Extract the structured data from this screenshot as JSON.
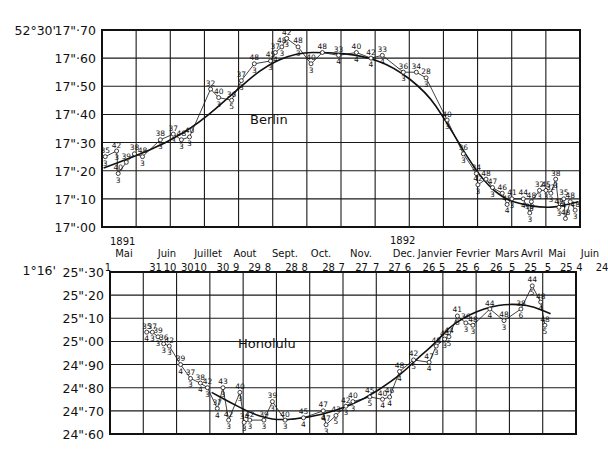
{
  "chart_data": [
    {
      "type": "line",
      "title": "Berlin",
      "station": "Berlin",
      "ylabel_prefix": "52°30'",
      "ylim": [
        17.0,
        17.7
      ],
      "ytick_labels": [
        "17\"·70",
        "17\"·60",
        "17\"·50",
        "17\"·40",
        "17\"·30",
        "17\"·20",
        "17\"·10",
        "17\"·00"
      ],
      "ytick_values": [
        17.7,
        17.6,
        17.5,
        17.4,
        17.3,
        17.2,
        17.1,
        17.0
      ],
      "xlim": [
        0,
        14
      ],
      "grid": true,
      "x_units": "months from 1891 Mai 1",
      "observations": [
        {
          "x": 0.1,
          "y": 17.25,
          "top": "35",
          "bottom": "3"
        },
        {
          "x": 0.45,
          "y": 17.27,
          "top": "42",
          "bottom": "3"
        },
        {
          "x": 0.5,
          "y": 17.19,
          "top": "40",
          "bottom": "3"
        },
        {
          "x": 0.75,
          "y": 17.23,
          "top": "39",
          "bottom": ""
        },
        {
          "x": 1.0,
          "y": 17.26,
          "top": "38",
          "bottom": ""
        },
        {
          "x": 1.25,
          "y": 17.25,
          "top": "48",
          "bottom": "3"
        },
        {
          "x": 1.8,
          "y": 17.31,
          "top": "38",
          "bottom": "3"
        },
        {
          "x": 2.2,
          "y": 17.33,
          "top": "37",
          "bottom": "3"
        },
        {
          "x": 2.45,
          "y": 17.31,
          "top": "48",
          "bottom": "3"
        },
        {
          "x": 2.7,
          "y": 17.32,
          "top": "40",
          "bottom": "3"
        },
        {
          "x": 3.35,
          "y": 17.49,
          "top": "32",
          "bottom": ""
        },
        {
          "x": 3.6,
          "y": 17.46,
          "top": "40",
          "bottom": "3"
        },
        {
          "x": 4.0,
          "y": 17.45,
          "top": "36",
          "bottom": "5"
        },
        {
          "x": 4.3,
          "y": 17.52,
          "top": "37",
          "bottom": "3"
        },
        {
          "x": 4.7,
          "y": 17.58,
          "top": "48",
          "bottom": "3"
        },
        {
          "x": 5.2,
          "y": 17.59,
          "top": "45",
          "bottom": "3"
        },
        {
          "x": 5.35,
          "y": 17.62,
          "top": "37",
          "bottom": "4"
        },
        {
          "x": 5.55,
          "y": 17.64,
          "top": "48",
          "bottom": "3"
        },
        {
          "x": 5.7,
          "y": 17.67,
          "top": "42",
          "bottom": "3"
        },
        {
          "x": 6.05,
          "y": 17.64,
          "top": "48",
          "bottom": "3"
        },
        {
          "x": 6.45,
          "y": 17.58,
          "top": "40",
          "bottom": "3"
        },
        {
          "x": 6.8,
          "y": 17.62,
          "top": "48",
          "bottom": ""
        },
        {
          "x": 7.3,
          "y": 17.61,
          "top": "33",
          "bottom": "4"
        },
        {
          "x": 7.85,
          "y": 17.62,
          "top": "40",
          "bottom": "4"
        },
        {
          "x": 8.3,
          "y": 17.6,
          "top": "42",
          "bottom": "4"
        },
        {
          "x": 8.65,
          "y": 17.61,
          "top": "33",
          "bottom": "4"
        },
        {
          "x": 9.3,
          "y": 17.55,
          "top": "36",
          "bottom": "3"
        },
        {
          "x": 9.7,
          "y": 17.55,
          "top": "34",
          "bottom": ""
        },
        {
          "x": 10.0,
          "y": 17.53,
          "top": "28",
          "bottom": "3"
        },
        {
          "x": 10.65,
          "y": 17.38,
          "top": "40",
          "bottom": "3"
        },
        {
          "x": 11.15,
          "y": 17.26,
          "top": "36",
          "bottom": "3"
        },
        {
          "x": 11.55,
          "y": 17.19,
          "top": "34",
          "bottom": ""
        },
        {
          "x": 11.6,
          "y": 17.15,
          "top": "42",
          "bottom": "3"
        },
        {
          "x": 11.85,
          "y": 17.17,
          "top": "48",
          "bottom": ""
        },
        {
          "x": 12.05,
          "y": 17.14,
          "top": "47",
          "bottom": "3"
        },
        {
          "x": 12.35,
          "y": 17.12,
          "top": "46",
          "bottom": ""
        },
        {
          "x": 12.5,
          "y": 17.08,
          "top": "45",
          "bottom": "4"
        },
        {
          "x": 12.65,
          "y": 17.1,
          "top": "41",
          "bottom": "3"
        },
        {
          "x": 13.0,
          "y": 17.1,
          "top": "44",
          "bottom": "4"
        },
        {
          "x": 13.25,
          "y": 17.09,
          "top": "48",
          "bottom": "3"
        },
        {
          "x": 13.2,
          "y": 17.05,
          "top": "39",
          "bottom": "3"
        },
        {
          "x": 13.5,
          "y": 17.13,
          "top": "32",
          "bottom": "3"
        },
        {
          "x": 13.7,
          "y": 17.13,
          "top": "45",
          "bottom": "3"
        },
        {
          "x": 13.85,
          "y": 17.12,
          "top": "32",
          "bottom": "3"
        }
      ],
      "observations_tail": [
        {
          "x": 14.0,
          "y": 17.17,
          "top": "38",
          "bottom": "3"
        },
        {
          "x": 14.1,
          "y": 17.07,
          "top": "48",
          "bottom": "3"
        },
        {
          "x": 14.25,
          "y": 17.1,
          "top": "35",
          "bottom": "4"
        },
        {
          "x": 14.45,
          "y": 17.09,
          "top": "48",
          "bottom": ""
        },
        {
          "x": 14.3,
          "y": 17.03,
          "top": "48",
          "bottom": ""
        },
        {
          "x": 14.6,
          "y": 17.06,
          "top": "48",
          "bottom": "3"
        }
      ],
      "mean_curve": [
        [
          0.05,
          17.21
        ],
        [
          1.0,
          17.25
        ],
        [
          2.0,
          17.3
        ],
        [
          3.0,
          17.37
        ],
        [
          4.0,
          17.47
        ],
        [
          5.0,
          17.57
        ],
        [
          6.0,
          17.62
        ],
        [
          7.0,
          17.62
        ],
        [
          8.0,
          17.61
        ],
        [
          9.0,
          17.57
        ],
        [
          10.0,
          17.48
        ],
        [
          10.6,
          17.38
        ],
        [
          11.2,
          17.26
        ],
        [
          11.8,
          17.16
        ],
        [
          12.4,
          17.1
        ],
        [
          13.0,
          17.08
        ],
        [
          13.5,
          17.07
        ],
        [
          14.0,
          17.07
        ],
        [
          14.7,
          17.09
        ]
      ]
    },
    {
      "type": "line",
      "title": "Honolulu",
      "station": "Honolulu",
      "ylabel_prefix": "1°16'",
      "ylim": [
        24.6,
        25.3
      ],
      "ytick_labels": [
        "25\"·30",
        "25\"·20",
        "25\"·10",
        "25\"·00",
        "24\"·90",
        "24\"·80",
        "24\"·70",
        "24\"·60"
      ],
      "ytick_values": [
        25.3,
        25.2,
        25.1,
        25.0,
        24.9,
        24.8,
        24.7,
        24.6
      ],
      "xlim": [
        0,
        14
      ],
      "grid": true,
      "observations": [
        {
          "x": 1.3,
          "y": 25.04,
          "top": "35",
          "bottom": "4"
        },
        {
          "x": 1.5,
          "y": 25.04,
          "top": "37",
          "bottom": "3"
        },
        {
          "x": 1.7,
          "y": 25.02,
          "top": "39",
          "bottom": "3"
        },
        {
          "x": 1.9,
          "y": 24.99,
          "top": "36",
          "bottom": "3"
        },
        {
          "x": 2.1,
          "y": 24.98,
          "top": "42",
          "bottom": "3"
        },
        {
          "x": 2.5,
          "y": 24.9,
          "top": "39",
          "bottom": "4"
        },
        {
          "x": 2.85,
          "y": 24.84,
          "top": "37",
          "bottom": "3"
        },
        {
          "x": 3.2,
          "y": 24.82,
          "top": "38",
          "bottom": "4"
        },
        {
          "x": 3.45,
          "y": 24.8,
          "top": "42",
          "bottom": "3"
        },
        {
          "x": 3.8,
          "y": 24.71,
          "top": "37",
          "bottom": "4"
        },
        {
          "x": 4.0,
          "y": 24.8,
          "top": "43",
          "bottom": "3"
        },
        {
          "x": 4.2,
          "y": 24.66,
          "top": "42",
          "bottom": "3"
        },
        {
          "x": 4.6,
          "y": 24.78,
          "top": "40",
          "bottom": "3"
        },
        {
          "x": 4.75,
          "y": 24.65,
          "top": "34",
          "bottom": "3"
        },
        {
          "x": 4.95,
          "y": 24.66,
          "top": "42",
          "bottom": "3"
        },
        {
          "x": 5.45,
          "y": 24.66,
          "top": "39",
          "bottom": "3"
        },
        {
          "x": 5.75,
          "y": 24.74,
          "top": "39",
          "bottom": "3"
        },
        {
          "x": 6.2,
          "y": 24.66,
          "top": "40",
          "bottom": "3"
        },
        {
          "x": 6.85,
          "y": 24.67,
          "top": "45",
          "bottom": "4"
        },
        {
          "x": 7.55,
          "y": 24.7,
          "top": "47",
          "bottom": "4"
        },
        {
          "x": 7.65,
          "y": 24.64,
          "top": "47",
          "bottom": "3"
        },
        {
          "x": 8.0,
          "y": 24.68,
          "top": "43",
          "bottom": "5"
        },
        {
          "x": 8.35,
          "y": 24.72,
          "top": "42",
          "bottom": "3"
        },
        {
          "x": 8.6,
          "y": 24.74,
          "top": "40",
          "bottom": "3"
        },
        {
          "x": 9.2,
          "y": 24.76,
          "top": "45",
          "bottom": "5"
        },
        {
          "x": 9.65,
          "y": 24.75,
          "top": "40",
          "bottom": "4"
        },
        {
          "x": 9.9,
          "y": 24.76,
          "top": "46",
          "bottom": "4"
        },
        {
          "x": 10.25,
          "y": 24.87,
          "top": "48",
          "bottom": "4"
        },
        {
          "x": 10.75,
          "y": 24.92,
          "top": "42",
          "bottom": "5"
        },
        {
          "x": 11.3,
          "y": 24.91,
          "top": "47",
          "bottom": "4"
        },
        {
          "x": 11.55,
          "y": 24.98,
          "top": "48",
          "bottom": "3"
        },
        {
          "x": 11.85,
          "y": 25.01,
          "top": "44",
          "bottom": "3"
        },
        {
          "x": 12.0,
          "y": 25.02,
          "top": "44",
          "bottom": "5"
        },
        {
          "x": 12.3,
          "y": 25.11,
          "top": "41",
          "bottom": "6"
        },
        {
          "x": 12.6,
          "y": 25.08,
          "top": "36",
          "bottom": "3"
        },
        {
          "x": 12.85,
          "y": 25.07,
          "top": "48",
          "bottom": "3"
        },
        {
          "x": 13.45,
          "y": 25.14,
          "top": "44",
          "bottom": "4"
        },
        {
          "x": 13.95,
          "y": 25.09,
          "top": "48",
          "bottom": "3"
        },
        {
          "x": 14.55,
          "y": 25.14,
          "top": "38",
          "bottom": "6"
        },
        {
          "x": 14.95,
          "y": 25.24,
          "top": "44",
          "bottom": "5"
        },
        {
          "x": 15.25,
          "y": 25.17,
          "top": "48",
          "bottom": "4"
        },
        {
          "x": 15.4,
          "y": 25.07,
          "top": "48",
          "bottom": "5"
        }
      ],
      "mean_curve": [
        [
          3.6,
          24.78
        ],
        [
          4.2,
          24.74
        ],
        [
          5.0,
          24.69
        ],
        [
          5.5,
          24.67
        ],
        [
          6.0,
          24.66
        ],
        [
          7.0,
          24.67
        ],
        [
          8.0,
          24.7
        ],
        [
          9.0,
          24.75
        ],
        [
          10.0,
          24.83
        ],
        [
          10.5,
          24.88
        ],
        [
          11.0,
          24.94
        ],
        [
          11.5,
          24.99
        ],
        [
          12.0,
          25.06
        ],
        [
          12.5,
          25.1
        ],
        [
          13.0,
          25.13
        ],
        [
          13.5,
          25.15
        ],
        [
          14.0,
          25.16
        ],
        [
          14.5,
          25.16
        ],
        [
          15.0,
          25.15
        ],
        [
          15.6,
          25.12
        ]
      ]
    }
  ],
  "x_axis": {
    "year_start": "1891",
    "year_next": "1892",
    "months": [
      "Mai",
      "Juin",
      "Juillet",
      "Aout",
      "Sept.",
      "Oct.",
      "Nov.",
      "Dec.",
      "Janvier",
      "Fevrier",
      "Mars",
      "Avril",
      "Mai",
      "Juin"
    ],
    "day_labels": [
      "1",
      "31",
      "10",
      "30",
      "10",
      "30",
      "9",
      "29",
      "8",
      "28",
      "8",
      "28",
      "7",
      "27",
      "7",
      "27",
      "6",
      "26",
      "5",
      "25",
      "6",
      "26",
      "5",
      "25",
      "5",
      "25",
      "4",
      "24"
    ]
  }
}
